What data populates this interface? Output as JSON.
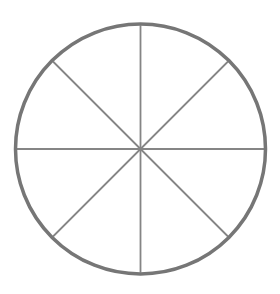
{
  "diagram": {
    "type": "divided-circle",
    "sectors": 8,
    "canvas": {
      "width": 280,
      "height": 294,
      "background": "#ffffff"
    },
    "circle": {
      "cx": 140.5,
      "cy": 149,
      "r": 125,
      "stroke": "#767676",
      "stroke_width": 3.5,
      "fill": "#ffffff"
    },
    "spokes": {
      "stroke": "#858585",
      "stroke_width": 1.8,
      "angles_deg": [
        0,
        45,
        90,
        135
      ]
    }
  }
}
